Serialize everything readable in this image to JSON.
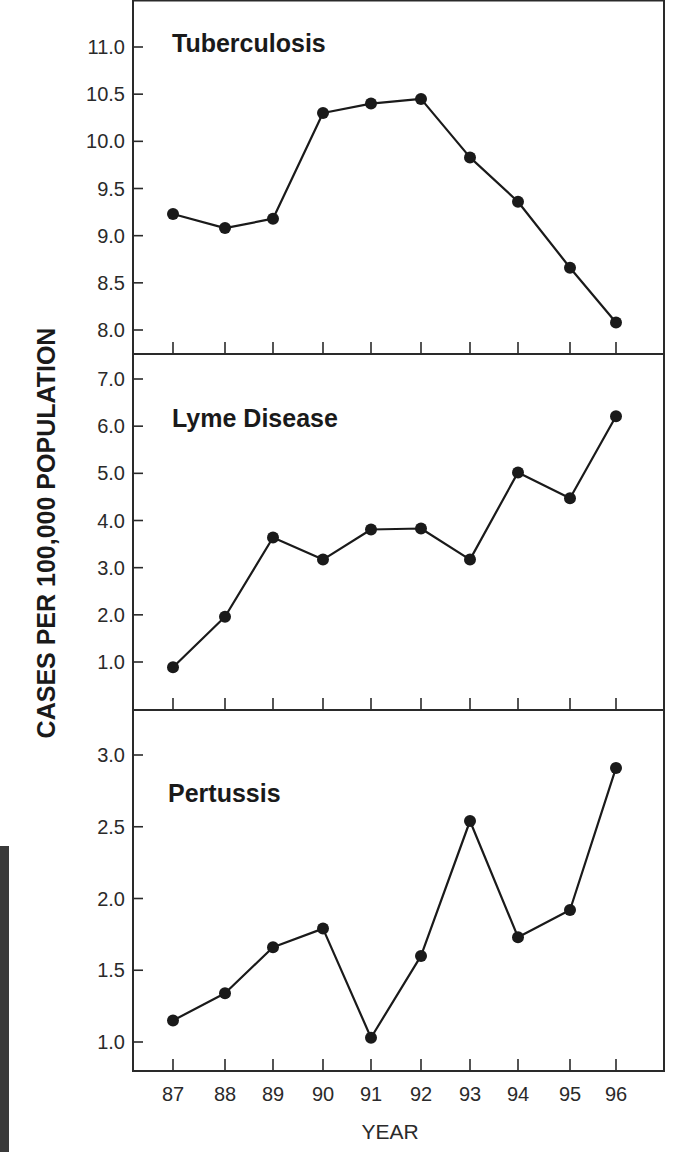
{
  "chart_data": [
    {
      "type": "line",
      "title": "Tuberculosis",
      "xlabel": "YEAR",
      "ylabel": "CASES PER 100,000 POPULATION",
      "x": [
        "87",
        "88",
        "89",
        "90",
        "91",
        "92",
        "93",
        "94",
        "95",
        "96"
      ],
      "values": [
        9.23,
        9.08,
        9.18,
        10.3,
        10.4,
        10.45,
        9.83,
        9.36,
        8.66,
        8.08
      ],
      "yticks": [
        8.0,
        8.5,
        9.0,
        9.5,
        10.0,
        10.5,
        11.0
      ],
      "ytick_labels": [
        "8.0",
        "8.5",
        "9.0",
        "9.5",
        "10.0",
        "10.5",
        "11.0"
      ],
      "ylim": [
        7.75,
        11.5
      ],
      "grid": false
    },
    {
      "type": "line",
      "title": "Lyme Disease",
      "xlabel": "YEAR",
      "ylabel": "CASES PER 100,000 POPULATION",
      "x": [
        "87",
        "88",
        "89",
        "90",
        "91",
        "92",
        "93",
        "94",
        "95",
        "96"
      ],
      "values": [
        0.89,
        1.96,
        3.64,
        3.17,
        3.81,
        3.83,
        3.17,
        5.02,
        4.47,
        6.21
      ],
      "yticks": [
        1.0,
        2.0,
        3.0,
        4.0,
        5.0,
        6.0,
        7.0
      ],
      "ytick_labels": [
        "1.0",
        "2.0",
        "3.0",
        "4.0",
        "5.0",
        "6.0",
        "7.0"
      ],
      "ylim": [
        0.0,
        7.5
      ],
      "grid": false
    },
    {
      "type": "line",
      "title": "Pertussis",
      "xlabel": "YEAR",
      "ylabel": "CASES PER 100,000 POPULATION",
      "x": [
        "87",
        "88",
        "89",
        "90",
        "91",
        "92",
        "93",
        "94",
        "95",
        "96"
      ],
      "values": [
        1.15,
        1.34,
        1.66,
        1.79,
        1.03,
        1.6,
        2.54,
        1.73,
        1.92,
        2.91
      ],
      "yticks": [
        1.0,
        1.5,
        2.0,
        2.5,
        3.0
      ],
      "ytick_labels": [
        "1.0",
        "1.5",
        "2.0",
        "2.5",
        "3.0"
      ],
      "ylim": [
        0.8,
        3.3
      ],
      "grid": false
    }
  ],
  "figure": {
    "y_axis_title": "CASES PER 100,000 POPULATION",
    "x_axis_title": "YEAR",
    "x_tick_labels": [
      "87",
      "88",
      "89",
      "90",
      "91",
      "92",
      "93",
      "94",
      "95",
      "96"
    ],
    "panel_titles": [
      "Tuberculosis",
      "Lyme Disease",
      "Pertussis"
    ],
    "colors": {
      "line": "#1a1a1a",
      "marker": "#1a1a1a",
      "frame": "#2a2a2a",
      "background": "#ffffff",
      "side_strip": "#3a3a3a"
    }
  }
}
